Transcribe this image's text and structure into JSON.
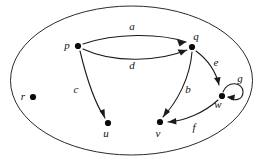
{
  "figure": {
    "type": "directed-graph",
    "boundary_shape": "ellipse",
    "background_color": "#ffffff",
    "stroke_color": "#1a1a1a",
    "node_color": "#0a0a0a"
  },
  "nodes": [
    {
      "id": "p",
      "label": "p",
      "x": 78,
      "y": 46,
      "label_x": 67,
      "label_y": 49
    },
    {
      "id": "q",
      "label": "q",
      "x": 192,
      "y": 47,
      "label_x": 196,
      "label_y": 40
    },
    {
      "id": "r",
      "label": "r",
      "x": 33,
      "y": 97,
      "label_x": 23,
      "label_y": 100
    },
    {
      "id": "u",
      "label": "u",
      "x": 108,
      "y": 123,
      "label_x": 106,
      "label_y": 137
    },
    {
      "id": "v",
      "label": "v",
      "x": 160,
      "y": 122,
      "label_x": 158,
      "label_y": 137
    },
    {
      "id": "w",
      "label": "w",
      "x": 222,
      "y": 96,
      "label_x": 218,
      "label_y": 108
    }
  ],
  "edges": [
    {
      "id": "a",
      "label": "a",
      "from": "p",
      "to": "q",
      "label_x": 132,
      "label_y": 30
    },
    {
      "id": "d",
      "label": "d",
      "from": "p",
      "to": "q",
      "label_x": 132,
      "label_y": 69
    },
    {
      "id": "c",
      "label": "c",
      "from": "p",
      "to": "u",
      "label_x": 76,
      "label_y": 93
    },
    {
      "id": "b",
      "label": "b",
      "from": "q",
      "to": "v",
      "label_x": 188,
      "label_y": 93
    },
    {
      "id": "e",
      "label": "e",
      "from": "q",
      "to": "w",
      "label_x": 216,
      "label_y": 66
    },
    {
      "id": "f",
      "label": "f",
      "from": "w",
      "to": "v",
      "label_x": 194,
      "label_y": 131
    },
    {
      "id": "g",
      "label": "g",
      "from": "w",
      "to": "w",
      "label_x": 240,
      "label_y": 82,
      "self_loop": true
    }
  ]
}
